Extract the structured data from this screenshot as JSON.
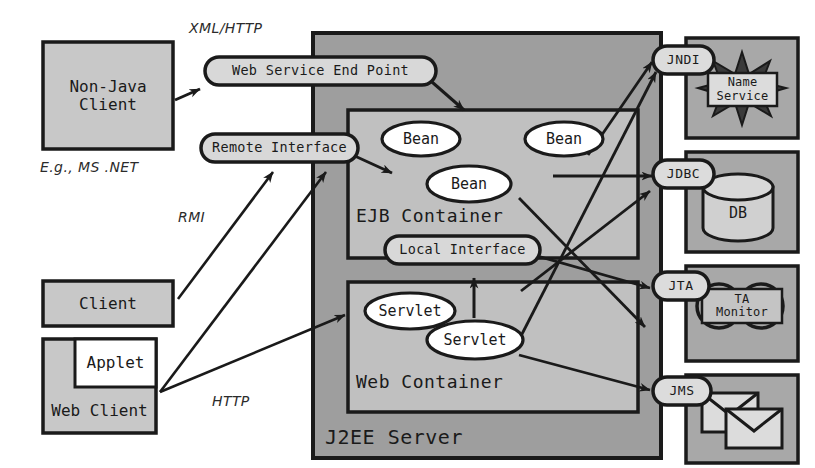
{
  "diagram": {
    "colors": {
      "server_fill": "#9e9e9e",
      "container_fill": "#c0c0c0",
      "client_fill": "#c8c8c8",
      "pill_fill": "#d8d8d8",
      "bean_fill": "#ffffff",
      "service_box_fill": "#a8a8a8",
      "stroke": "#1a1a1a",
      "background": "#ffffff"
    },
    "clients": [
      {
        "id": "non-java-client",
        "label": "Non-Java\nClient"
      },
      {
        "id": "client",
        "label": "Client"
      },
      {
        "id": "web-client",
        "label": "Web Client"
      },
      {
        "id": "applet",
        "label": "Applet"
      }
    ],
    "annotations": [
      {
        "id": "eg-ms-net",
        "label": "E.g.,  MS .NET"
      },
      {
        "id": "xml-http",
        "label": "XML/HTTP"
      },
      {
        "id": "rmi",
        "label": "RMI"
      },
      {
        "id": "http",
        "label": "HTTP"
      }
    ],
    "server": {
      "label": "J2EE Server",
      "interfaces": [
        {
          "id": "web-service-end-point",
          "label": "Web Service End Point"
        },
        {
          "id": "remote-interface",
          "label": "Remote Interface"
        },
        {
          "id": "local-interface",
          "label": "Local Interface"
        }
      ],
      "containers": [
        {
          "id": "ejb-container",
          "label": "EJB Container",
          "components": [
            {
              "id": "bean-1",
              "label": "Bean"
            },
            {
              "id": "bean-2",
              "label": "Bean"
            },
            {
              "id": "bean-3",
              "label": "Bean"
            }
          ]
        },
        {
          "id": "web-container",
          "label": "Web Container",
          "components": [
            {
              "id": "servlet-1",
              "label": "Servlet"
            },
            {
              "id": "servlet-2",
              "label": "Servlet"
            }
          ]
        }
      ]
    },
    "services": [
      {
        "id": "jndi",
        "api": "JNDI",
        "resource": "Name\nService",
        "resource_icon": "starburst-icon"
      },
      {
        "id": "jdbc",
        "api": "JDBC",
        "resource": "DB",
        "resource_icon": "database-cylinder-icon"
      },
      {
        "id": "jta",
        "api": "JTA",
        "resource": "TA\nMonitor",
        "resource_icon": "gears-icon"
      },
      {
        "id": "jms",
        "api": "JMS",
        "resource": "",
        "resource_icon": "envelopes-icon"
      }
    ]
  }
}
